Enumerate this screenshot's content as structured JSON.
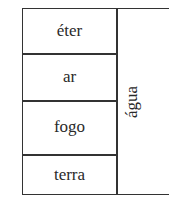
{
  "diagram": {
    "left_column": [
      {
        "label": "éter"
      },
      {
        "label": "ar"
      },
      {
        "label": "fogo"
      },
      {
        "label": "terra"
      }
    ],
    "right_column": {
      "label": "água"
    }
  }
}
